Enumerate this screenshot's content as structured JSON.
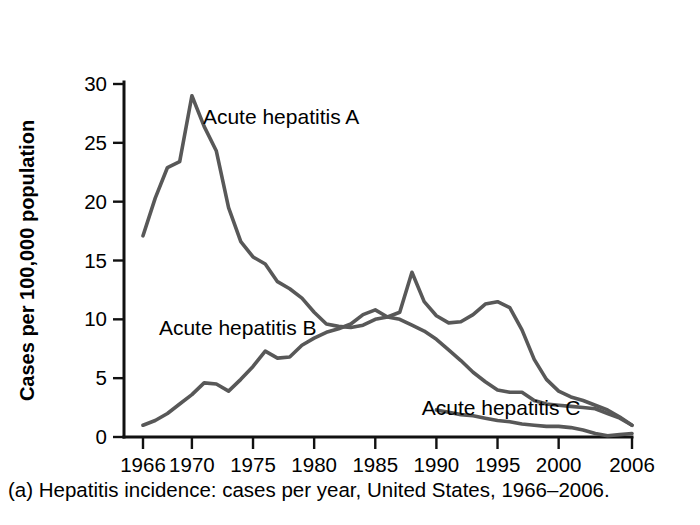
{
  "caption": "(a) Hepatitis incidence: cases per year, United States, 1966–2006.",
  "chart_data": {
    "type": "line",
    "title": "",
    "xlabel": "",
    "ylabel": "Cases per 100,000 population",
    "xlim": [
      1966,
      2006
    ],
    "ylim": [
      0,
      30
    ],
    "xticks": [
      1966,
      1970,
      1975,
      1980,
      1985,
      1990,
      1995,
      2000,
      2006
    ],
    "xtick_labels": [
      "1966",
      "1970",
      "1975",
      "1980",
      "1985",
      "1990",
      "1995",
      "2000",
      "2006"
    ],
    "yticks": [
      0,
      5,
      10,
      15,
      20,
      25,
      30
    ],
    "ytick_labels": [
      "0",
      "5",
      "10",
      "15",
      "20",
      "25",
      "30"
    ],
    "grid": false,
    "legend_position": "inline-annotations",
    "line_color": "#585858",
    "axis_color": "#111111",
    "series": [
      {
        "name": "Acute hepatitis A",
        "label": "Acute hepatitis A",
        "label_x": 1970.9,
        "label_y": 27.2,
        "color": "#585858",
        "x": [
          1966,
          1967,
          1968,
          1969,
          1970,
          1971,
          1972,
          1973,
          1974,
          1975,
          1976,
          1977,
          1978,
          1979,
          1980,
          1981,
          1982,
          1983,
          1984,
          1985,
          1986,
          1987,
          1988,
          1989,
          1990,
          1991,
          1992,
          1993,
          1994,
          1995,
          1996,
          1997,
          1998,
          1999,
          2000,
          2001,
          2002,
          2003,
          2004,
          2005,
          2006
        ],
        "values": [
          17.1,
          20.3,
          22.9,
          23.4,
          29.0,
          26.4,
          24.3,
          19.5,
          16.6,
          15.3,
          14.7,
          13.2,
          12.6,
          11.8,
          10.6,
          9.6,
          9.4,
          9.3,
          9.5,
          10.0,
          10.2,
          10.6,
          14.0,
          11.5,
          10.3,
          9.7,
          9.8,
          10.4,
          11.3,
          11.5,
          11.0,
          9.1,
          6.6,
          4.9,
          3.9,
          3.4,
          3.1,
          2.7,
          2.3,
          1.7,
          1.0
        ]
      },
      {
        "name": "Acute hepatitis B",
        "label": "Acute hepatitis B",
        "label_x": 1967.3,
        "label_y": 9.3,
        "color": "#585858",
        "x": [
          1966,
          1967,
          1968,
          1969,
          1970,
          1971,
          1972,
          1973,
          1974,
          1975,
          1976,
          1977,
          1978,
          1979,
          1980,
          1981,
          1982,
          1983,
          1984,
          1985,
          1986,
          1987,
          1988,
          1989,
          1990,
          1991,
          1992,
          1993,
          1994,
          1995,
          1996,
          1997,
          1998,
          1999,
          2000,
          2001,
          2002,
          2003,
          2004,
          2005,
          2006
        ],
        "values": [
          1.0,
          1.4,
          2.0,
          2.8,
          3.6,
          4.6,
          4.5,
          3.9,
          4.9,
          6.0,
          7.3,
          6.7,
          6.8,
          7.8,
          8.4,
          8.9,
          9.2,
          9.6,
          10.4,
          10.8,
          10.2,
          10.0,
          9.5,
          9.0,
          8.3,
          7.4,
          6.5,
          5.5,
          4.7,
          4.0,
          3.8,
          3.8,
          3.1,
          2.8,
          2.7,
          2.6,
          2.5,
          2.4,
          2.0,
          1.6,
          1.0
        ]
      },
      {
        "name": "Acute hepatitis C",
        "label": "Acute hepatitis C",
        "label_x": 1988.8,
        "label_y": 2.45,
        "color": "#585858",
        "x": [
          1990,
          1991,
          1992,
          1993,
          1994,
          1995,
          1996,
          1997,
          1998,
          1999,
          2000,
          2001,
          2002,
          2003,
          2004,
          2005,
          2006
        ],
        "values": [
          2.3,
          2.1,
          1.9,
          1.8,
          1.6,
          1.4,
          1.3,
          1.1,
          1.0,
          0.9,
          0.9,
          0.8,
          0.6,
          0.3,
          0.1,
          0.2,
          0.3
        ]
      }
    ]
  }
}
